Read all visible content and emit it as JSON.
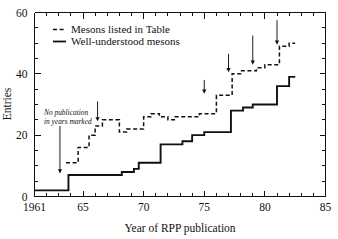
{
  "chart_data": {
    "type": "line",
    "title": "",
    "xlabel": "Year of RPP publication",
    "ylabel": "Entries",
    "xlim": [
      1961,
      1985
    ],
    "ylim": [
      0,
      60
    ],
    "grid": false,
    "legend_position": "upper-left",
    "x_ticks_major": [
      1961,
      1965,
      1970,
      1975,
      1980,
      1985
    ],
    "x_tick_labels": [
      "1961",
      "65",
      "70",
      "75",
      "80",
      "85"
    ],
    "x_tick_minor_step": 1,
    "y_ticks_major": [
      0,
      20,
      40,
      60
    ],
    "y_tick_labels": [
      "0",
      "20",
      "40",
      "60"
    ],
    "y_tick_minor_step": 5,
    "series": [
      {
        "name": "Mesons listed in Table",
        "style": "dashed",
        "step": "post",
        "x": [
          1963.6,
          1964.0,
          1964.6,
          1965.0,
          1965.5,
          1966.0,
          1966.6,
          1967.3,
          1968.0,
          1968.6,
          1969.3,
          1970.0,
          1970.6,
          1971.3,
          1972.0,
          1972.6,
          1973.3,
          1974.0,
          1974.6,
          1975.0,
          1976.0,
          1976.7,
          1977.3,
          1978.0,
          1978.6,
          1979.3,
          1980.0,
          1980.6,
          1981.2,
          1982.0,
          1982.5
        ],
        "y": [
          11,
          11,
          16,
          16,
          20,
          23,
          25,
          25,
          21,
          22,
          22,
          26,
          27,
          26,
          25,
          26,
          26,
          26,
          27,
          27,
          33,
          33,
          40,
          41,
          41,
          42,
          43,
          43,
          49,
          50,
          50
        ]
      },
      {
        "name": "Well-understood mesons",
        "style": "solid",
        "step": "post",
        "x": [
          1961.0,
          1962.0,
          1963.8,
          1965.5,
          1966.3,
          1967.5,
          1968.2,
          1969.2,
          1969.6,
          1970.4,
          1971.4,
          1972.0,
          1973.2,
          1974.0,
          1975.0,
          1975.6,
          1976.4,
          1977.2,
          1978.2,
          1979.0,
          1980.2,
          1981.0,
          1982.0,
          1982.5
        ],
        "y": [
          2,
          2,
          7,
          7,
          7,
          7,
          8,
          9,
          11,
          11,
          17,
          17,
          18,
          20,
          21,
          21,
          21,
          28,
          29,
          30,
          30,
          36,
          39,
          39
        ]
      }
    ],
    "annotations": [
      {
        "name": "no-publication-note",
        "text_line1": "No publication",
        "text_line2": "in years marked",
        "x": 1963.2,
        "y": 26.5
      }
    ],
    "arrows": [
      {
        "x": 1963.1,
        "y_top": 23.0,
        "y_tip": 7.5
      },
      {
        "x": 1966.2,
        "y_top": 31.0,
        "y_tip": 24.5
      },
      {
        "x": 1975.0,
        "y_top": 38.0,
        "y_tip": 33.5
      },
      {
        "x": 1977.0,
        "y_top": 46.5,
        "y_tip": 40.5
      },
      {
        "x": 1979.0,
        "y_top": 52.5,
        "y_tip": 43.0
      },
      {
        "x": 1981.0,
        "y_top": 57.5,
        "y_tip": 49.5
      }
    ],
    "legend": [
      {
        "label": "Mesons listed in Table",
        "style": "dashed"
      },
      {
        "label": "Well-understood mesons",
        "style": "solid"
      }
    ],
    "colors": {
      "ink": "#111111",
      "background": "#ffffff"
    }
  }
}
